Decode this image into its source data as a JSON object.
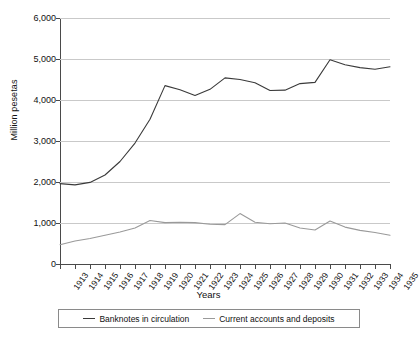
{
  "chart_data": {
    "type": "line",
    "title": "",
    "xlabel": "Years",
    "ylabel": "Million pesetas",
    "categories": [
      "1913",
      "1914",
      "1915",
      "1916",
      "1917",
      "1918",
      "1919",
      "1920",
      "1921",
      "1922",
      "1923",
      "1924",
      "1925",
      "1926",
      "1927",
      "1928",
      "1929",
      "1930",
      "1931",
      "1932",
      "1933",
      "1934",
      "1935"
    ],
    "ylim": [
      0,
      6000
    ],
    "yticks": [
      0,
      1000,
      2000,
      3000,
      4000,
      5000,
      6000
    ],
    "ytick_labels": [
      "0",
      "1,000",
      "2,000",
      "3,000",
      "4,000",
      "5,000",
      "6,000"
    ],
    "grid": true,
    "legend_position": "bottom",
    "series": [
      {
        "name": "Banknotes in circulation",
        "color": "#3a3a3a",
        "values": [
          1960,
          1930,
          1990,
          2170,
          2500,
          2950,
          3530,
          4350,
          4250,
          4110,
          4260,
          4540,
          4500,
          4420,
          4230,
          4240,
          4400,
          4430,
          4980,
          4860,
          4790,
          4750,
          4810
        ]
      },
      {
        "name": "Current accounts and deposits",
        "color": "#9a9a9a",
        "values": [
          470,
          560,
          620,
          700,
          780,
          880,
          1060,
          1010,
          1020,
          1010,
          970,
          960,
          1230,
          1020,
          980,
          1000,
          880,
          830,
          1050,
          900,
          820,
          770,
          700
        ]
      }
    ]
  },
  "legend": {
    "entries": [
      {
        "label": "Banknotes in circulation"
      },
      {
        "label": "Current accounts and deposits"
      }
    ]
  }
}
